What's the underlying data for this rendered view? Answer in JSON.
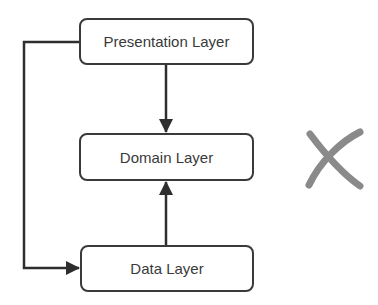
{
  "diagram": {
    "nodes": [
      {
        "id": "presentation",
        "label": "Presentation Layer"
      },
      {
        "id": "domain",
        "label": "Domain Layer"
      },
      {
        "id": "data",
        "label": "Data Layer"
      }
    ],
    "edges": [
      {
        "from": "presentation",
        "to": "domain"
      },
      {
        "from": "data",
        "to": "domain"
      },
      {
        "from": "presentation",
        "to": "data"
      }
    ],
    "marker": {
      "symbol": "X",
      "meaning": "incorrect",
      "color": "#8a8a8a"
    },
    "line_color": "#2e2e2e"
  }
}
